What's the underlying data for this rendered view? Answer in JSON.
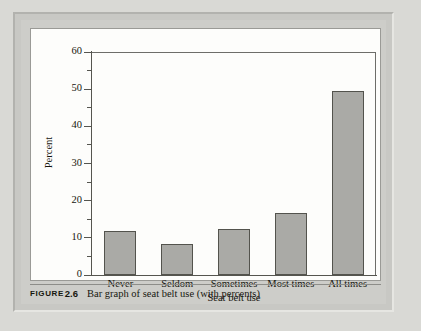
{
  "figure": {
    "caption_label": "FIGURE",
    "caption_number": "2.6",
    "caption_text": "Bar graph of seat belt use (with percents)"
  },
  "colors": {
    "bar_fill": "#aaaaa6",
    "bar_stroke": "#53534d",
    "axis": "#55554f",
    "panel_background": "#fdfdfb",
    "frame": "#c8c8c4",
    "page_background": "#d9d9d5"
  },
  "chart_data": {
    "type": "bar",
    "title": "",
    "categories": [
      "Never",
      "Seldom",
      "Sometimes",
      "Most times",
      "All times"
    ],
    "values": [
      11.9,
      8.3,
      12.4,
      16.7,
      49.5
    ],
    "xlabel": "Seat belt use",
    "ylabel": "Percent",
    "ylim": [
      0,
      60
    ],
    "ytick_major": [
      0,
      10,
      20,
      30,
      40,
      50,
      60
    ],
    "ytick_labels": [
      "0",
      "10",
      "20",
      "30",
      "40",
      "50",
      "60"
    ],
    "ytick_minor": [
      5,
      15,
      25,
      35,
      45,
      55
    ],
    "grid": false,
    "legend": false
  }
}
